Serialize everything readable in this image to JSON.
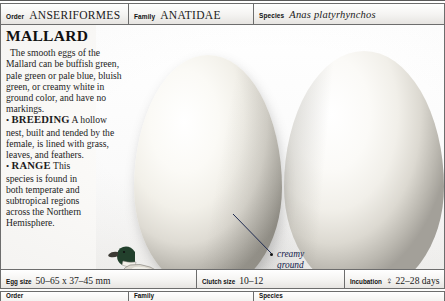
{
  "header": {
    "order": {
      "label": "Order",
      "value": "ANSERIFORMES"
    },
    "family": {
      "label": "Family",
      "value": "ANATIDAE"
    },
    "species": {
      "label": "Species",
      "value": "Anas platyrhynchos"
    }
  },
  "entry": {
    "title": "MALLARD",
    "description": "The smooth eggs of the Mallard can be buffish green, pale green or pale blue, bluish green, or creamy white in ground color, and have no markings.",
    "sections": [
      {
        "bullet": "•",
        "keyword": "BREEDING",
        "text": "A hollow nest, built and tended by the female, is lined with grass, leaves, and feathers."
      },
      {
        "bullet": "•",
        "keyword": "RANGE",
        "text": "This species is found in both temperate and subtropical regions across the Northern Hemisphere."
      }
    ]
  },
  "plate": {
    "callout": "creamy\nground",
    "egg_left_name": "mallard-egg-left",
    "egg_right_name": "mallard-egg-right",
    "bird_name": "mallard-drake-illustration"
  },
  "footer": {
    "egg_size": {
      "label": "Egg size",
      "value": "50–65 x 37–45 mm"
    },
    "clutch_size": {
      "label": "Clutch size",
      "value": "10–12"
    },
    "incubation": {
      "label": "Incubation",
      "value": "♀ 22–28 days"
    }
  },
  "next_entry": {
    "order": {
      "label": "Order",
      "value": ""
    },
    "family": {
      "label": "Family",
      "value": ""
    },
    "species": {
      "label": "Species",
      "value": ""
    }
  },
  "colors": {
    "rule": "#6d6d6d",
    "paper": "#fbfaf8",
    "egg_highlight": "#ffffff",
    "egg_shadow": "#9a978f",
    "callout_text": "#12204a",
    "drake_head": "#1d3326",
    "drake_breast": "#6b4a33",
    "drake_body": "#d8d5cd"
  }
}
